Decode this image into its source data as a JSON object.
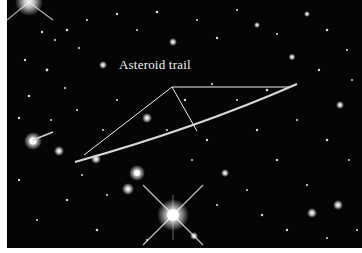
{
  "image": {
    "subject": "Star field with an asteroid trail",
    "annotation": {
      "label": "Asteroid trail",
      "label_color": "#f2f2f2",
      "pointer_lines": 3
    },
    "colors": {
      "sky": "#050505",
      "trail": "#d8d8d8",
      "stars": "#ffffff",
      "border": "#ffffff"
    }
  }
}
